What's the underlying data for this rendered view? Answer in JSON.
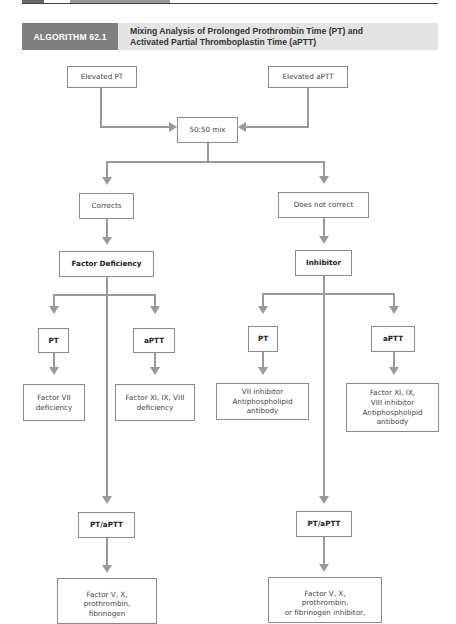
{
  "header": {
    "tag": "ALGORITHM 62.1",
    "title_line1": "Mixing Analysis of Prolonged Prothrombin Time (PT) and",
    "title_line2": "Activated Partial Thromboplastin Time (aPTT)"
  },
  "nodes": {
    "elevated_pt": "Elevated PT",
    "elevated_aptt": "Elevated aPTT",
    "mix": "50:50 mix",
    "corrects": "Corrects",
    "does_not_correct": "Does not correct",
    "factor_deficiency": "Factor Deficiency",
    "inhibitor": "Inhibitor",
    "fd_pt": "PT",
    "fd_aptt": "aPTT",
    "inh_pt": "PT",
    "inh_aptt": "aPTT",
    "fd_pt_result": "Factor VII deficiency",
    "fd_aptt_result": "Factor XI, IX, VIII deficiency",
    "inh_pt_result_l1": "VII inhibitor",
    "inh_pt_result_l2": "Antiphospholipid antibody",
    "inh_aptt_result_l1": "Factor XI, IX,",
    "inh_aptt_result_l2": "VIII inhibitor",
    "inh_aptt_result_l3": "Antiphospholipid antibody",
    "fd_both": "PT/aPTT",
    "inh_both": "PT/aPTT",
    "fd_both_result_l1": "Factor V, X,",
    "fd_both_result_l2": "prothrombin,",
    "fd_both_result_l3": "fibrinogen",
    "inh_both_result_l1": "Factor V, X,",
    "inh_both_result_l2": "prothrombin,",
    "inh_both_result_l3": "or fibrinogen inhibitor,"
  }
}
